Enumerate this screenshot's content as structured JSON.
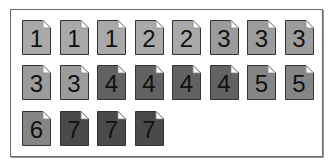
{
  "documents": [
    {
      "label": "1",
      "color": "#a9a9a9"
    },
    {
      "label": "1",
      "color": "#a9a9a9"
    },
    {
      "label": "1",
      "color": "#a9a9a9"
    },
    {
      "label": "2",
      "color": "#a9a9a9"
    },
    {
      "label": "2",
      "color": "#a9a9a9"
    },
    {
      "label": "3",
      "color": "#9c9c9c"
    },
    {
      "label": "3",
      "color": "#9c9c9c"
    },
    {
      "label": "3",
      "color": "#9c9c9c"
    },
    {
      "label": "3",
      "color": "#9c9c9c"
    },
    {
      "label": "3",
      "color": "#9c9c9c"
    },
    {
      "label": "4",
      "color": "#626262"
    },
    {
      "label": "4",
      "color": "#626262"
    },
    {
      "label": "4",
      "color": "#626262"
    },
    {
      "label": "4",
      "color": "#626262"
    },
    {
      "label": "5",
      "color": "#858585"
    },
    {
      "label": "5",
      "color": "#858585"
    },
    {
      "label": "6",
      "color": "#858585"
    },
    {
      "label": "7",
      "color": "#4a4a4a"
    },
    {
      "label": "7",
      "color": "#4a4a4a"
    },
    {
      "label": "7",
      "color": "#4a4a4a"
    }
  ]
}
